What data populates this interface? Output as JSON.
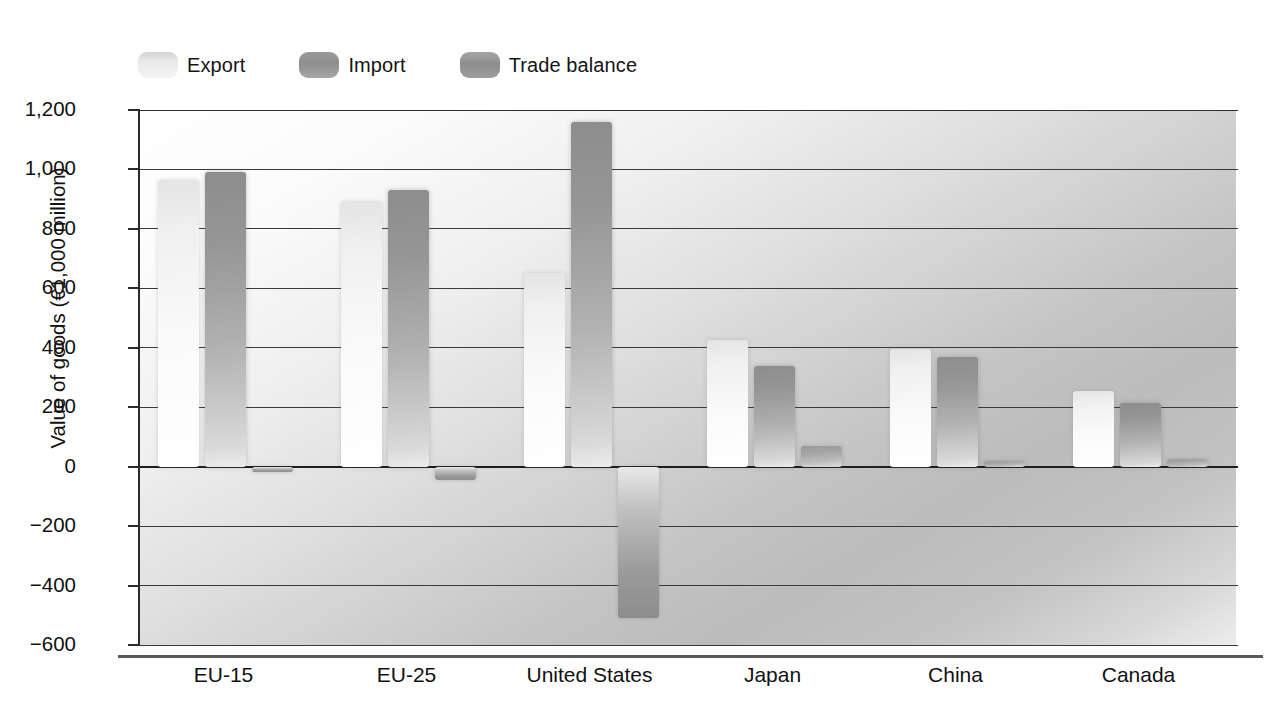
{
  "chart_data": {
    "type": "bar",
    "title": "",
    "subtitle": "",
    "xlabel": "",
    "ylabel": "Value of goods (€1,000 million)",
    "categories": [
      "EU-15",
      "EU-25",
      "United States",
      "Japan",
      "China",
      "Canada"
    ],
    "series": [
      {
        "name": "Export",
        "values": [
          965,
          890,
          650,
          425,
          395,
          255
        ]
      },
      {
        "name": "Import",
        "values": [
          990,
          930,
          1160,
          340,
          370,
          215
        ]
      },
      {
        "name": "Trade balance",
        "values": [
          -10,
          -45,
          -510,
          70,
          20,
          25
        ]
      }
    ],
    "ylim": [
      -600,
      1200
    ],
    "yticks": [
      1200,
      1000,
      800,
      600,
      400,
      200,
      0,
      -200,
      -400,
      -600
    ],
    "ytick_labels": [
      "1,200",
      "1,000",
      "800",
      "600",
      "400",
      "200",
      "0",
      "−200",
      "−400",
      "−600"
    ],
    "grid": true,
    "legend_position": "top-left",
    "legend": [
      "Export",
      "Import",
      "Trade balance"
    ],
    "colors": {
      "export": "#f4f4f4",
      "import": "#9a9a9a",
      "balance": "#a0a0a0",
      "gridline": "#3a3a3a",
      "axis": "#2b2b2b",
      "text": "#111111"
    }
  },
  "legend": {
    "items": [
      {
        "label": "Export",
        "swatch": "export-swatch-icon"
      },
      {
        "label": "Import",
        "swatch": "import-swatch-icon"
      },
      {
        "label": "Trade balance",
        "swatch": "trade-balance-swatch-icon"
      }
    ]
  },
  "axes": {
    "y_title": "Value of goods (€1,000 million)",
    "y_labels": [
      "1,200",
      "1,000",
      "800",
      "600",
      "400",
      "200",
      "0",
      "−200",
      "−400",
      "−600"
    ],
    "x_labels": [
      "EU-15",
      "EU-25",
      "United States",
      "Japan",
      "China",
      "Canada"
    ]
  }
}
